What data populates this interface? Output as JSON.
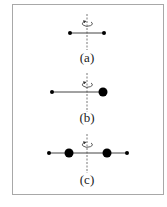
{
  "figure": {
    "panels": [
      {
        "id": "a",
        "label": "(a)",
        "description": "two equal small masses on rod, axis at center"
      },
      {
        "id": "b",
        "label": "(b)",
        "description": "small mass and large mass on rod, axis near large mass"
      },
      {
        "id": "c",
        "label": "(c)",
        "description": "symmetric: two small outer masses and two large inner masses, axis at center"
      }
    ],
    "colors": {
      "frame": "#a8a8a8",
      "mass": "#000000",
      "rod": "#444444",
      "axis": "#555555"
    }
  }
}
